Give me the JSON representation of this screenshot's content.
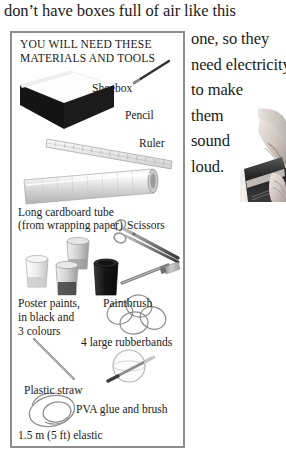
{
  "page": {
    "top_text": "don’t have boxes full of air like this",
    "right_column": [
      "one, so they",
      "need electricity",
      "to make",
      "them",
      "sound",
      "loud."
    ],
    "photo": {
      "caption": "",
      "alt_name": "hands-playing-instrument-photo"
    }
  },
  "materials_box": {
    "heading_line1": "YOU WILL NEED THESE",
    "heading_line2": "MATERIALS AND TOOLS",
    "items": [
      {
        "label": "Shoebox",
        "icon": "shoebox-illustration"
      },
      {
        "label": "Pencil",
        "icon": "pencil-illustration"
      },
      {
        "label": "Ruler",
        "icon": "ruler-illustration"
      },
      {
        "label": "Long cardboard tube",
        "icon": "cardboard-tube-illustration"
      },
      {
        "label": "(from wrapping paper)",
        "icon": "none"
      },
      {
        "label": "Scissors",
        "icon": "scissors-illustration"
      },
      {
        "label": "Poster paints,",
        "icon": "paint-pots-illustration"
      },
      {
        "label": "in black and",
        "icon": "none"
      },
      {
        "label": "3 colours",
        "icon": "none"
      },
      {
        "label": "Paintbrush",
        "icon": "paintbrush-illustration"
      },
      {
        "label": "4 large rubberbands",
        "icon": "rubberbands-illustration"
      },
      {
        "label": "Plastic straw",
        "icon": "plastic-straw-illustration"
      },
      {
        "label": "PVA glue and brush",
        "icon": "glue-and-brush-illustration"
      },
      {
        "label": "1.5 m (5 ft) elastic",
        "icon": "elastic-coil-illustration"
      }
    ]
  },
  "colors": {
    "border": "#8d8d8d",
    "text": "#1a1a1a",
    "shoebox_dark": "#141414",
    "tube_gray": "#d3d3d3",
    "paint_dark": "#1c1c1c"
  }
}
